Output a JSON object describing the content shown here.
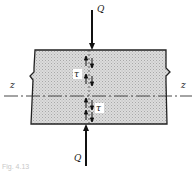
{
  "diagram": {
    "type": "beam-section-shear-stress",
    "labels": {
      "force_top": "Q",
      "force_bottom": "Q",
      "axis_left": "z",
      "axis_right": "z",
      "shear_upper": "τ",
      "shear_lower": "τ"
    },
    "caption": "Fig. 4.13",
    "colors": {
      "fill": "#d4d4d4",
      "stroke": "#222222",
      "background": "#ffffff"
    }
  }
}
